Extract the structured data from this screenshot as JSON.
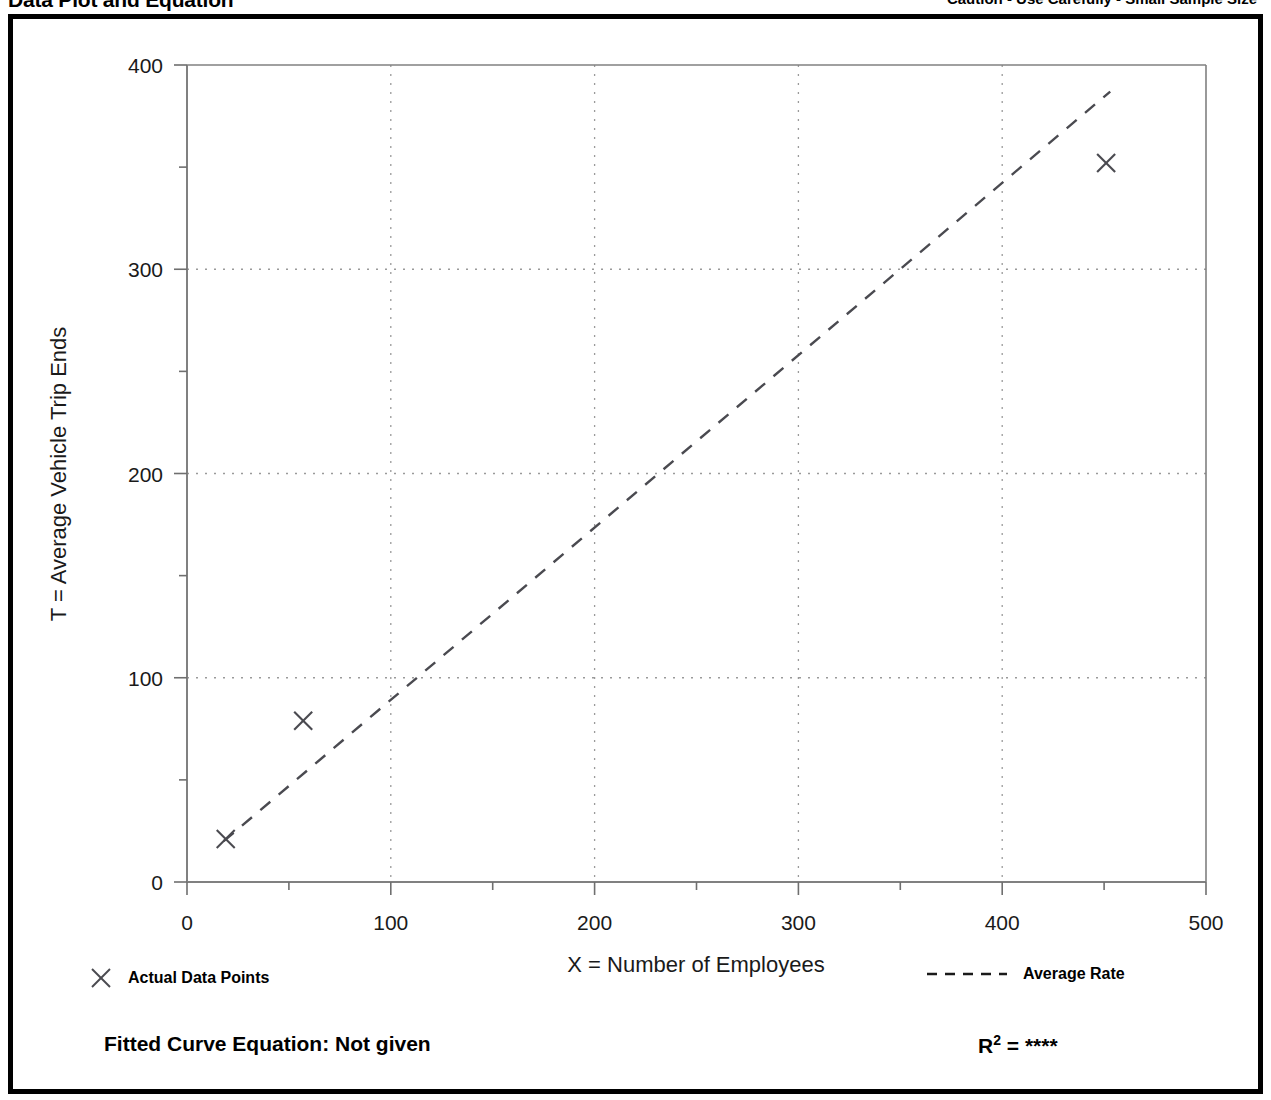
{
  "header": {
    "title": "Data Plot and Equation",
    "caution": "Caution - Use Carefully - Small Sample Size"
  },
  "legend": {
    "points_label": "Actual Data Points",
    "points_marker": "x-marker-icon",
    "line_label": "Average Rate",
    "line_marker": "dashed-line-icon"
  },
  "footer": {
    "equation_label": "Fitted Curve Equation:  Not given",
    "r2_prefix": "R",
    "r2_exponent": "2",
    "r2_equals": " = ",
    "r2_value": "****"
  },
  "colors": {
    "ink": "#1a1a1a",
    "frame": "#000000",
    "grid": "#9a9a9a",
    "axis": "#6f6f6f",
    "series": "#4a4a50"
  },
  "chart_data": {
    "type": "scatter",
    "title": "Data Plot and Equation",
    "xlabel": "X = Number of Employees",
    "ylabel": "T = Average Vehicle Trip Ends",
    "xlim": [
      0,
      500
    ],
    "ylim": [
      0,
      400
    ],
    "xticks": [
      0,
      100,
      200,
      300,
      400,
      500
    ],
    "yticks": [
      0,
      100,
      200,
      300,
      400
    ],
    "xminor_step": 50,
    "yminor_step": 50,
    "grid": true,
    "grid_style": "dotted",
    "legend_position": "below-plot",
    "series": [
      {
        "name": "Actual Data Points",
        "type": "scatter",
        "marker": "x",
        "points": [
          {
            "x": 19,
            "y": 21
          },
          {
            "x": 57,
            "y": 79
          },
          {
            "x": 451,
            "y": 352
          }
        ]
      },
      {
        "name": "Average Rate",
        "type": "line",
        "style": "dashed",
        "points": [
          {
            "x": 18,
            "y": 20
          },
          {
            "x": 453,
            "y": 387
          }
        ]
      }
    ],
    "annotations": {
      "fitted_curve_equation": "Not given",
      "r_squared": "****",
      "caution": "Caution - Use Carefully - Small Sample Size"
    }
  }
}
